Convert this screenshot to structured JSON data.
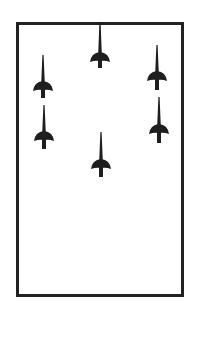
{
  "diagram": {
    "type": "formation-diagram",
    "frame": {
      "x": 16,
      "y": 22,
      "width": 168,
      "height": 275,
      "border_color": "#222222"
    },
    "icon": "fencing-foil-icon",
    "icon_color": "#1e1e1e",
    "figures": [
      {
        "id": "top-center",
        "cx": 100,
        "top": 22,
        "dome_y": 58,
        "bottom": 68
      },
      {
        "id": "left-upper",
        "cx": 43,
        "top": 55,
        "dome_y": 87,
        "bottom": 98
      },
      {
        "id": "right-upper",
        "cx": 157,
        "top": 45,
        "dome_y": 77,
        "bottom": 90
      },
      {
        "id": "left-lower",
        "cx": 44,
        "top": 105,
        "dome_y": 137,
        "bottom": 149
      },
      {
        "id": "right-lower",
        "cx": 159,
        "top": 97,
        "dome_y": 130,
        "bottom": 143
      },
      {
        "id": "bottom-center",
        "cx": 101,
        "top": 132,
        "dome_y": 165,
        "bottom": 177
      }
    ]
  }
}
